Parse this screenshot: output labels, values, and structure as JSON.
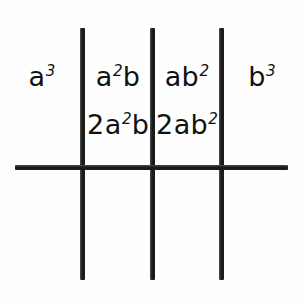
{
  "figure": {
    "kind": "math-expansion-grid",
    "background_color": "#fefefe",
    "ink_color": "#1b1b1b"
  },
  "grid": {
    "vertical_rules": [
      {
        "name": "vertical-rule-1",
        "x": 80,
        "y": 28,
        "height": 252,
        "thickness": 5
      },
      {
        "name": "vertical-rule-2",
        "x": 150,
        "y": 28,
        "height": 252,
        "thickness": 5
      },
      {
        "name": "vertical-rule-3",
        "x": 219,
        "y": 28,
        "height": 252,
        "thickness": 5
      }
    ],
    "horizontal_rules": [
      {
        "name": "horizontal-rule-1",
        "x": 15,
        "y": 165,
        "width": 273,
        "thickness": 5
      }
    ]
  },
  "cells": {
    "row1": [
      {
        "base1": "a",
        "exp1": "3",
        "base2": "",
        "exp2": "",
        "coefficient": "",
        "plain": "a3"
      },
      {
        "base1": "a",
        "exp1": "2",
        "base2": "b",
        "exp2": "",
        "coefficient": "",
        "plain": "a2b"
      },
      {
        "base1": "a",
        "exp1": "",
        "base2": "b",
        "exp2": "2",
        "coefficient": "",
        "plain": "ab2"
      },
      {
        "base1": "b",
        "exp1": "3",
        "base2": "",
        "exp2": "",
        "coefficient": "",
        "plain": "b3"
      }
    ],
    "row2": [
      {
        "base1": "a",
        "exp1": "2",
        "base2": "b",
        "exp2": "",
        "coefficient": "2",
        "plain": "2a2b"
      },
      {
        "base1": "a",
        "exp1": "",
        "base2": "b",
        "exp2": "2",
        "coefficient": "2",
        "plain": "2ab2"
      }
    ]
  }
}
